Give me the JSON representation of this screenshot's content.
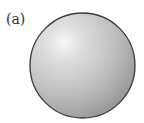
{
  "figure": {
    "label": "(a)",
    "shape": "sphere",
    "colors": {
      "highlight": "#f4f4f4",
      "mid": "#c4c4c4",
      "shadow": "#9a9a9a",
      "outline": "#3a3a3a"
    }
  }
}
